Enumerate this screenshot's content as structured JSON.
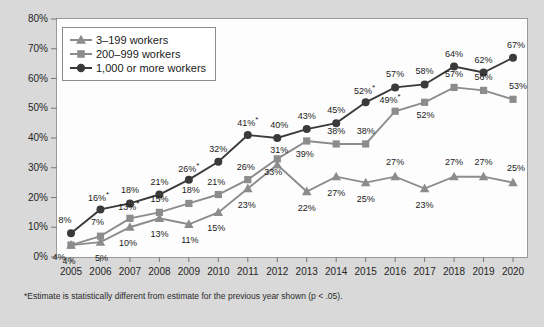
{
  "chart_data": {
    "type": "line",
    "title": "",
    "subtitle": "",
    "xlabel": "",
    "ylabel": "",
    "grid": false,
    "legend_position": "top-left",
    "ylim": [
      0,
      80
    ],
    "ytick_labels": [
      "0%",
      "10%",
      "20%",
      "30%",
      "40%",
      "50%",
      "60%",
      "70%",
      "80%"
    ],
    "ytick_values": [
      0,
      10,
      20,
      30,
      40,
      50,
      60,
      70,
      80
    ],
    "categories": [
      "2005",
      "2006",
      "2007",
      "2008",
      "2009",
      "2010",
      "2011",
      "2012",
      "2013",
      "2014",
      "2015",
      "2016",
      "2017",
      "2018",
      "2019",
      "2020"
    ],
    "series": [
      {
        "name": "3–199 workers",
        "marker": "triangle",
        "color": "#8c8c8c",
        "values": [
          4,
          5,
          10,
          13,
          11,
          15,
          23,
          31,
          22,
          27,
          25,
          27,
          23,
          27,
          27,
          25
        ],
        "data_labels": [
          "4%",
          "5%",
          "10%",
          "13%",
          "11%",
          "15%",
          "23%",
          "31%",
          "22%",
          "27%",
          "25%",
          "27%",
          "23%",
          "27%",
          "27%",
          "25%"
        ],
        "significant": [
          false,
          false,
          false,
          false,
          false,
          false,
          false,
          false,
          false,
          false,
          false,
          false,
          false,
          false,
          false,
          false
        ]
      },
      {
        "name": "200–999 workers",
        "marker": "square",
        "color": "#8c8c8c",
        "values": [
          4,
          7,
          13,
          15,
          18,
          21,
          26,
          33,
          39,
          38,
          38,
          49,
          52,
          57,
          56,
          53
        ],
        "data_labels": [
          "4%",
          "7%",
          "13%",
          "15%",
          "18%",
          "21%",
          "26%",
          "33%",
          "39%",
          "38%",
          "38%",
          "49%",
          "52%",
          "57%",
          "56%",
          "53%"
        ],
        "significant": [
          false,
          false,
          true,
          false,
          false,
          false,
          false,
          false,
          false,
          false,
          false,
          true,
          false,
          false,
          false,
          false
        ]
      },
      {
        "name": "1,000 or more workers",
        "marker": "circle",
        "color": "#3a3a3a",
        "values": [
          8,
          16,
          18,
          21,
          26,
          32,
          41,
          40,
          43,
          45,
          52,
          57,
          58,
          64,
          62,
          67
        ],
        "data_labels": [
          "8%",
          "16%",
          "18%",
          "21%",
          "26%",
          "32%",
          "41%",
          "40%",
          "43%",
          "45%",
          "52%",
          "57%",
          "58%",
          "64%",
          "62%",
          "67%"
        ],
        "significant": [
          false,
          true,
          false,
          false,
          true,
          false,
          true,
          false,
          false,
          false,
          true,
          false,
          false,
          false,
          false,
          false
        ]
      }
    ],
    "footnote": "*Estimate is statistically different from estimate for the previous year shown (p < .05).",
    "significance_symbol": "*"
  }
}
